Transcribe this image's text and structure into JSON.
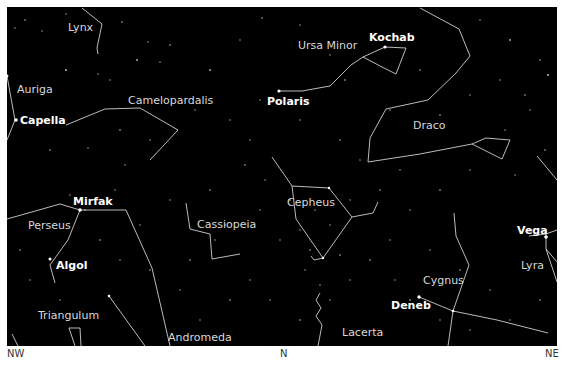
{
  "map": {
    "title": "Northern sky star chart",
    "background_color": "#000000",
    "line_color": "#cfcfcf",
    "label_color": "#d9d9d9",
    "constellations": [
      {
        "name": "Lynx"
      },
      {
        "name": "Auriga"
      },
      {
        "name": "Camelopardalis"
      },
      {
        "name": "Ursa Minor"
      },
      {
        "name": "Draco"
      },
      {
        "name": "Cepheus"
      },
      {
        "name": "Cassiopeia"
      },
      {
        "name": "Perseus"
      },
      {
        "name": "Triangulum"
      },
      {
        "name": "Andromeda"
      },
      {
        "name": "Lacerta"
      },
      {
        "name": "Cygnus"
      },
      {
        "name": "Lyra"
      }
    ],
    "stars": [
      {
        "name": "Capella"
      },
      {
        "name": "Polaris"
      },
      {
        "name": "Kochab"
      },
      {
        "name": "Mirfak"
      },
      {
        "name": "Algol"
      },
      {
        "name": "Deneb"
      },
      {
        "name": "Vega"
      }
    ],
    "directions": {
      "left": "NW",
      "center": "N",
      "right": "NE"
    }
  }
}
